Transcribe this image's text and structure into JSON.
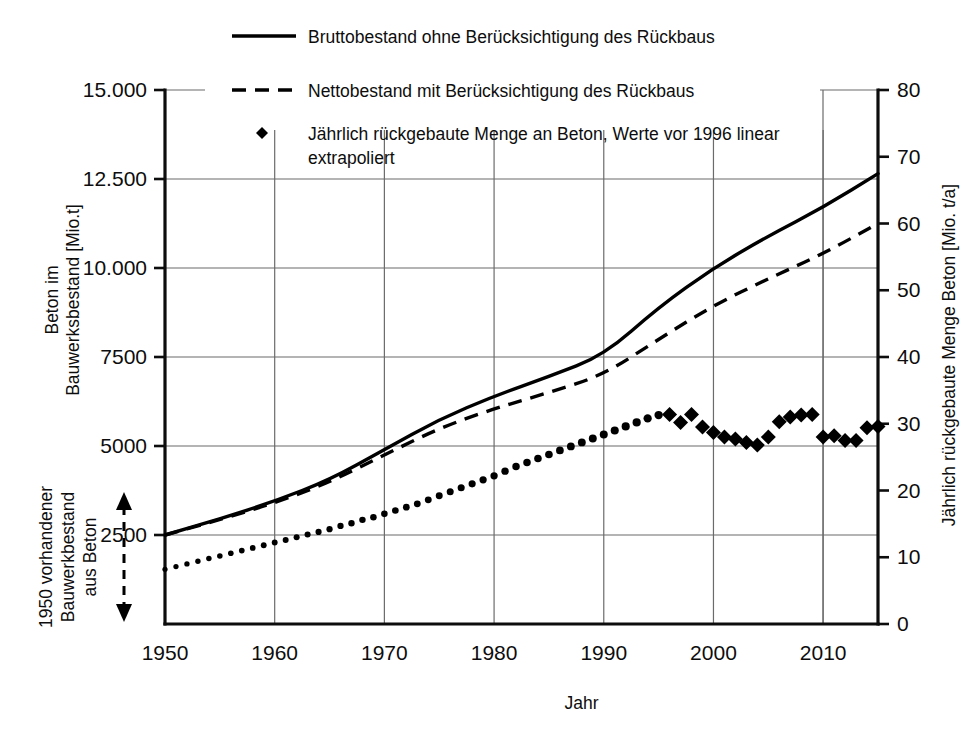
{
  "figure": {
    "background": "#ffffff",
    "ink": "#000000",
    "grid_color": "#6b6b6b"
  },
  "legend": {
    "position": "top-center",
    "items": [
      {
        "marker": "solid-line",
        "label": "Bruttobestand ohne Berücksichtigung des Rückbaus"
      },
      {
        "marker": "dashed-line",
        "label": "Nettobestand mit Berücksichtigung des Rückbaus"
      },
      {
        "marker": "diamond-point",
        "label_line1": "Jährlich rückgebaute Menge an Beton, Werte vor 1996 linear",
        "label_line2": "extrapoliert"
      }
    ]
  },
  "annotation": {
    "bracket_label_line1": "1950 vorhandener",
    "bracket_label_line2": "Bauwerkbestand",
    "bracket_label_line3": "aus Beton",
    "arrow_style": "double-headed-dashed"
  },
  "chart_data": {
    "type": "line",
    "title": "",
    "xlabel": "Jahr",
    "ylabel": "Beton im Bauwerksbestand [Mio.t]",
    "y2label": "Jährlich rückgebaute Menge Beton [Mio. t/a]",
    "xlim": [
      1950,
      2015
    ],
    "ylim": [
      0,
      15000
    ],
    "y2lim": [
      0,
      80
    ],
    "xticks": [
      1950,
      1960,
      1970,
      1980,
      1990,
      2000,
      2010
    ],
    "xticklabels": [
      "1950",
      "1960",
      "1970",
      "1980",
      "1990",
      "2000",
      "2010"
    ],
    "yticks": [
      2500,
      5000,
      7500,
      10000,
      12500,
      15000
    ],
    "yticklabels": [
      "2500",
      "5000",
      "7500",
      "10.000",
      "12.500",
      "15.000"
    ],
    "y2ticks": [
      0,
      10,
      20,
      30,
      40,
      50,
      60,
      70,
      80
    ],
    "y2ticklabels": [
      "0",
      "10",
      "20",
      "30",
      "40",
      "50",
      "60",
      "70",
      "80"
    ],
    "grid": true,
    "legend_position": "top-center",
    "series": [
      {
        "name": "Bruttobestand ohne Berücksichtigung des Rückbaus",
        "style": "solid",
        "axis": "left",
        "x": [
          1950,
          1955,
          1960,
          1965,
          1970,
          1975,
          1980,
          1985,
          1990,
          1995,
          2000,
          2005,
          2010,
          2015
        ],
        "values": [
          2500,
          2950,
          3450,
          4050,
          4900,
          5750,
          6400,
          6950,
          7550,
          8900,
          10000,
          10900,
          11700,
          12650
        ]
      },
      {
        "name": "Nettobestand mit Berücksichtigung des Rückbaus",
        "style": "dashed",
        "axis": "left",
        "x": [
          1950,
          1955,
          1960,
          1965,
          1970,
          1975,
          1980,
          1985,
          1990,
          1995,
          2000,
          2005,
          2010,
          2015
        ],
        "values": [
          2500,
          2930,
          3400,
          3980,
          4750,
          5500,
          6050,
          6500,
          7000,
          8000,
          8950,
          9700,
          10400,
          11250
        ]
      },
      {
        "name": "Jährlich rückgebaute Menge an Beton, Werte vor 1996 linear extrapoliert",
        "style": "points-diamond",
        "axis": "right",
        "x": [
          1950,
          1951,
          1952,
          1953,
          1954,
          1955,
          1956,
          1957,
          1958,
          1959,
          1960,
          1961,
          1962,
          1963,
          1964,
          1965,
          1966,
          1967,
          1968,
          1969,
          1970,
          1971,
          1972,
          1973,
          1974,
          1975,
          1976,
          1977,
          1978,
          1979,
          1980,
          1981,
          1982,
          1983,
          1984,
          1985,
          1986,
          1987,
          1988,
          1989,
          1990,
          1991,
          1992,
          1993,
          1994,
          1995,
          1996,
          1997,
          1998,
          1999,
          2000,
          2001,
          2002,
          2003,
          2004,
          2005,
          2006,
          2007,
          2008,
          2009,
          2010,
          2011,
          2012,
          2013,
          2014,
          2015
        ],
        "values": [
          8.2,
          8.6,
          9.0,
          9.4,
          9.8,
          10.2,
          10.6,
          11.0,
          11.4,
          11.8,
          12.2,
          12.6,
          13.0,
          13.4,
          13.8,
          14.2,
          14.7,
          15.1,
          15.6,
          16.0,
          16.5,
          17.0,
          17.5,
          18.0,
          18.6,
          19.2,
          19.8,
          20.4,
          21.0,
          21.6,
          22.2,
          22.9,
          23.6,
          24.2,
          24.8,
          25.4,
          26.0,
          26.6,
          27.2,
          27.8,
          28.4,
          29.0,
          29.6,
          30.2,
          30.8,
          31.3,
          31.4,
          30.2,
          31.4,
          29.5,
          28.7,
          28.0,
          27.7,
          27.2,
          26.8,
          28.0,
          30.3,
          31.0,
          31.3,
          31.4,
          28.0,
          28.2,
          27.5,
          27.5,
          29.4,
          29.6
        ],
        "pre_1996_style": "small-dot-extrapolated",
        "from_1996_style": "large-filled-diamond"
      }
    ]
  }
}
